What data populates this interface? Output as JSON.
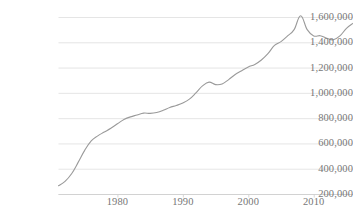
{
  "chart_data": {
    "type": "line",
    "title": "",
    "subtitle": "",
    "xlabel": "",
    "ylabel": "",
    "xlim": [
      1971,
      2016
    ],
    "ylim": [
      200000,
      1600000
    ],
    "grid": true,
    "legend": false,
    "legend_position": "none",
    "y_ticks": [
      200000,
      400000,
      600000,
      800000,
      1000000,
      1200000,
      1400000,
      1600000
    ],
    "y_tick_labels": [
      "200,000",
      "400,000",
      "600,000",
      "800,000",
      "1,000,000",
      "1,200,000",
      "1,400,000",
      "1,600,000"
    ],
    "x_ticks": [
      1980,
      1990,
      2000,
      2010
    ],
    "x_tick_labels": [
      "1980",
      "1990",
      "2000",
      "2010"
    ],
    "series_name": "",
    "line_color": "#9a9a9a",
    "grid_color": "#e2e2e2",
    "axis_color": "#d2d2d2",
    "text_color": "#777777",
    "x": [
      1971,
      1972,
      1973,
      1974,
      1975,
      1976,
      1977,
      1978,
      1979,
      1980,
      1981,
      1982,
      1983,
      1984,
      1985,
      1986,
      1987,
      1988,
      1989,
      1990,
      1991,
      1992,
      1993,
      1994,
      1995,
      1996,
      1997,
      1998,
      1999,
      2000,
      2001,
      2002,
      2003,
      2004,
      2005,
      2006,
      2007,
      2008,
      2009,
      2010,
      2011,
      2012,
      2013,
      2014,
      2015,
      2016
    ],
    "values": [
      265000,
      300000,
      360000,
      450000,
      545000,
      620000,
      660000,
      690000,
      720000,
      755000,
      790000,
      810000,
      825000,
      840000,
      838000,
      845000,
      862000,
      885000,
      900000,
      920000,
      950000,
      1000000,
      1055000,
      1085000,
      1065000,
      1070000,
      1105000,
      1145000,
      1175000,
      1205000,
      1225000,
      1260000,
      1310000,
      1375000,
      1405000,
      1450000,
      1500000,
      1610000,
      1500000,
      1450000,
      1452000,
      1432000,
      1420000,
      1450000,
      1510000,
      1550000
    ]
  },
  "axes": {
    "y_label_x_right": 52,
    "x_label_y": 196
  }
}
